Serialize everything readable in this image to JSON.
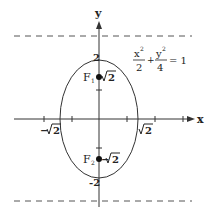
{
  "diagram": {
    "type": "ellipse-plot",
    "equation": {
      "x_num": "x",
      "x_exp": "2",
      "x_den": "2",
      "plus": "+",
      "y_num": "y",
      "y_exp": "2",
      "y_den": "4",
      "rhs": "= 1"
    },
    "axes": {
      "x_label": "x",
      "y_label": "y"
    },
    "intercepts": {
      "top": "2",
      "bottom": "-2",
      "left_root": "2",
      "left_sign": "−",
      "right_root": "2"
    },
    "foci": [
      {
        "name": "F",
        "sub": "1",
        "value_sign": "",
        "value_root": "2"
      },
      {
        "name": "F",
        "sub": "2",
        "value_sign": "−",
        "value_root": "2"
      }
    ],
    "directrices": [
      "dashed line above",
      "dashed line below"
    ],
    "colors": {
      "stroke": "#333333",
      "dashed": "#555555",
      "background": "#ffffff"
    }
  }
}
